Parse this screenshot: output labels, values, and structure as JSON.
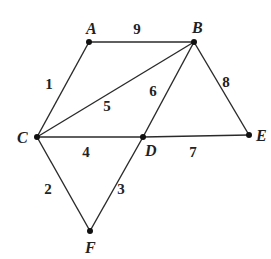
{
  "graph": {
    "type": "weighted-undirected-graph",
    "nodes": [
      {
        "id": "A",
        "label": "A",
        "x": 89,
        "y": 42,
        "lx": 86,
        "ly": 34
      },
      {
        "id": "B",
        "label": "B",
        "x": 194,
        "y": 42,
        "lx": 192,
        "ly": 33
      },
      {
        "id": "C",
        "label": "C",
        "x": 37,
        "y": 137,
        "lx": 17,
        "ly": 143
      },
      {
        "id": "D",
        "label": "D",
        "x": 143,
        "y": 137,
        "lx": 145,
        "ly": 156
      },
      {
        "id": "E",
        "label": "E",
        "x": 249,
        "y": 135,
        "lx": 256,
        "ly": 141
      },
      {
        "id": "F",
        "label": "F",
        "x": 90,
        "y": 231,
        "lx": 85,
        "ly": 253
      }
    ],
    "edges": [
      {
        "from": "A",
        "to": "B",
        "weight": "9",
        "wx": 137,
        "wy": 34
      },
      {
        "from": "A",
        "to": "C",
        "weight": "1",
        "wx": 49,
        "wy": 89
      },
      {
        "from": "B",
        "to": "C",
        "weight": "5",
        "wx": 107,
        "wy": 111
      },
      {
        "from": "B",
        "to": "D",
        "weight": "6",
        "wx": 153,
        "wy": 96
      },
      {
        "from": "B",
        "to": "E",
        "weight": "8",
        "wx": 226,
        "wy": 87
      },
      {
        "from": "C",
        "to": "D",
        "weight": "4",
        "wx": 86,
        "wy": 157
      },
      {
        "from": "D",
        "to": "E",
        "weight": "7",
        "wx": 193,
        "wy": 157
      },
      {
        "from": "C",
        "to": "F",
        "weight": "2",
        "wx": 48,
        "wy": 194
      },
      {
        "from": "D",
        "to": "F",
        "weight": "3",
        "wx": 121,
        "wy": 194
      }
    ]
  }
}
